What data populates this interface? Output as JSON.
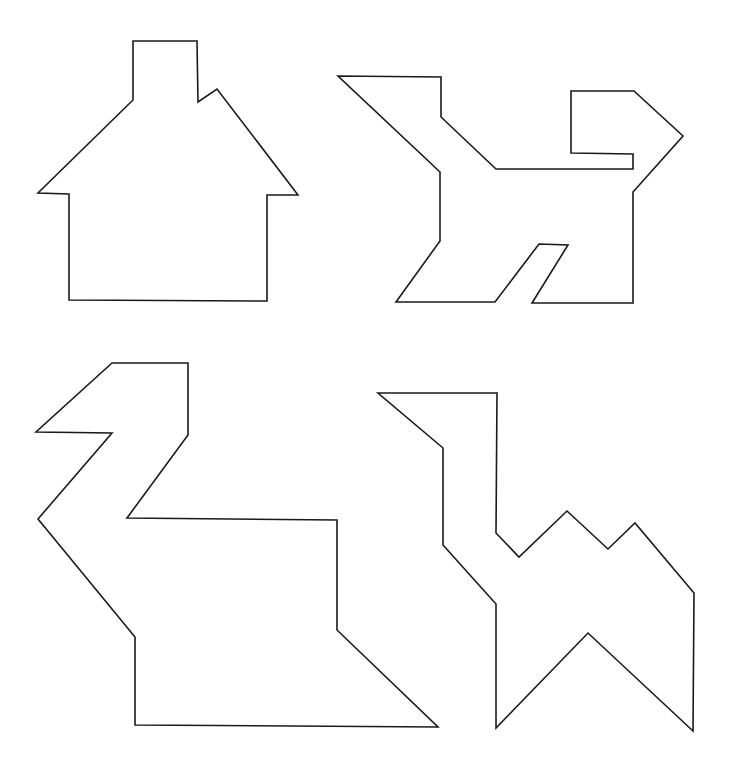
{
  "figure": {
    "description": "Four tangram silhouette outlines",
    "background": "#ffffff",
    "stroke_color": "#1a1a1a",
    "shapes": [
      {
        "name": "house",
        "points": "133,41 197,41 198,102 217,89 298,195 267,195 267,301 69,300 69,194 38,193 133,100"
      },
      {
        "name": "dog",
        "points": "338,76 441,77 441,117 496,169 633,169 633,154 571,153 571,91 634,91 683,136 633,192 633,303 532,303 568,245 539,244 495,302 396,302 440,241 440,172"
      },
      {
        "name": "swan",
        "points": "112,363 188,363 188,435 127,518 337,520 337,630 438,727 135,725 135,637 38,519 112,433 36,432"
      },
      {
        "name": "camel",
        "points": "378,393 497,393 496,533 519,557 567,511 608,549 635,523 694,593 693,731 588,633 496,728 496,604 443,545 443,448"
      }
    ]
  }
}
